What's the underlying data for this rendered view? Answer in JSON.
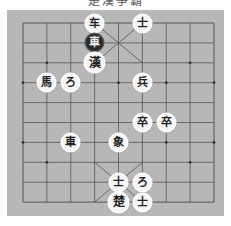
{
  "title": "楚漢爭霸",
  "board": {
    "background": "#b7b7b7",
    "line_color": "#555555",
    "columns": 9,
    "rows": 10,
    "grid_origin": [
      23,
      23
    ],
    "col_step": 23.875,
    "row_step": 19.9
  },
  "pieces": [
    {
      "label": "车",
      "col": 3,
      "row": 0,
      "side": "top",
      "type": "chariot"
    },
    {
      "label": "車",
      "col": 3,
      "row": 1,
      "side": "top",
      "type": "chariot",
      "selected": true
    },
    {
      "label": "漢",
      "col": 3,
      "row": 2,
      "side": "top",
      "type": "general"
    },
    {
      "label": "士",
      "col": 5,
      "row": 0,
      "side": "top",
      "type": "advisor"
    },
    {
      "label": "馬",
      "col": 1,
      "row": 3,
      "side": "top",
      "type": "horse"
    },
    {
      "label": "ろ",
      "col": 2,
      "row": 3,
      "side": "top",
      "type": "cannon"
    },
    {
      "label": "兵",
      "col": 5,
      "row": 3,
      "side": "bottom",
      "type": "soldier"
    },
    {
      "label": "卒",
      "col": 5,
      "row": 5,
      "side": "top",
      "type": "soldier"
    },
    {
      "label": "卒",
      "col": 6,
      "row": 5,
      "side": "top",
      "type": "soldier"
    },
    {
      "label": "車",
      "col": 2,
      "row": 6,
      "side": "top",
      "type": "chariot"
    },
    {
      "label": "象",
      "col": 4,
      "row": 6,
      "side": "top",
      "type": "elephant"
    },
    {
      "label": "士",
      "col": 4,
      "row": 8,
      "side": "bottom",
      "type": "advisor"
    },
    {
      "label": "ろ",
      "col": 5,
      "row": 8,
      "side": "bottom",
      "type": "cannon"
    },
    {
      "label": "楚",
      "col": 4,
      "row": 9,
      "side": "bottom",
      "type": "general"
    },
    {
      "label": "士",
      "col": 5,
      "row": 9,
      "side": "bottom",
      "type": "advisor"
    }
  ]
}
